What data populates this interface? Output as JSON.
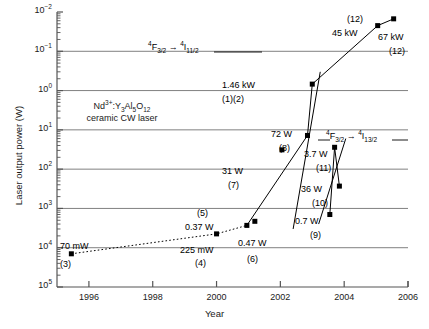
{
  "chart_data": {
    "type": "scatter",
    "title": "",
    "xlabel": "Year",
    "ylabel": "Laser output power (W)",
    "xlim": [
      1995,
      2006
    ],
    "ylim": [
      0.01,
      100000
    ],
    "yscale": "log",
    "xticks": [
      "1996",
      "1998",
      "2000",
      "2002",
      "2004",
      "2006"
    ],
    "xtick_values": [
      1996,
      1998,
      2000,
      2002,
      2004,
      2006
    ],
    "yticks": [
      "10⁻²",
      "10⁻¹",
      "10⁰",
      "10¹",
      "10²",
      "10³",
      "10⁴",
      "10⁵"
    ],
    "ytick_values": [
      0.01,
      0.1,
      1,
      10,
      100,
      1000,
      10000,
      100000
    ],
    "grid": "horizontal-major",
    "legend": "none",
    "points": [
      {
        "ref": "(3)",
        "label": "70 mW",
        "x": 1995.45,
        "y": 0.07,
        "label_pos": "above-right",
        "ref_pos": "below"
      },
      {
        "ref": "(4)",
        "label": "225 mW",
        "x": 2000.0,
        "y": 0.225,
        "label_pos": "below",
        "ref_pos": "below2"
      },
      {
        "ref": "(5)",
        "label": "0.37 W",
        "x": 2000.95,
        "y": 0.37,
        "label_pos": "above-left",
        "ref_pos": "above2"
      },
      {
        "ref": "(6)",
        "label": "0.47 W",
        "x": 2001.2,
        "y": 0.47,
        "label_pos": "right",
        "ref_pos": "below-right"
      },
      {
        "ref": "(7)",
        "label": "31 W",
        "x": 2002.05,
        "y": 31,
        "label_pos": "below",
        "ref_pos": "below2"
      },
      {
        "ref": "(8)",
        "label": "72 W",
        "x": 2002.85,
        "y": 72,
        "label_pos": "above-right",
        "ref_pos": "right-below"
      },
      {
        "ref": "(9)",
        "label": "0.7 W",
        "x": 2003.55,
        "y": 0.7,
        "label_pos": "right",
        "ref_pos": "below-right"
      },
      {
        "ref": "(10)",
        "label": "36 W",
        "x": 2003.7,
        "y": 36,
        "label_pos": "right",
        "ref_pos": "below-right"
      },
      {
        "ref": "(11)",
        "label": "3.7 W",
        "x": 2003.85,
        "y": 3.7,
        "label_pos": "right",
        "ref_pos": "below-right"
      },
      {
        "ref": "(1)(2)",
        "label": "1.46 kW",
        "x": 2003.0,
        "y": 1460,
        "label_pos": "left",
        "ref_pos": "left-below"
      },
      {
        "ref": "(12)",
        "label": "45 kW",
        "x": 2005.05,
        "y": 45000,
        "label_pos": "left",
        "ref_pos": "above-left"
      },
      {
        "ref": "(12)",
        "label": "67 kW",
        "x": 2005.55,
        "y": 67000,
        "label_pos": "below-right",
        "ref_pos": "below-right2"
      }
    ],
    "series": [
      {
        "name": "low-power trend",
        "style": "dotted",
        "x": [
          1995.45,
          2000.0,
          2000.95
        ],
        "y": [
          0.07,
          0.225,
          0.37
        ]
      },
      {
        "name": "4F3/2-4I11/2 trend",
        "style": "solid",
        "x": [
          2000.95,
          2002.85,
          2003.0,
          2005.05,
          2005.55
        ],
        "y": [
          0.37,
          72,
          1460,
          45000,
          67000
        ]
      },
      {
        "name": "4F3/2-4I13/2 trend",
        "style": "solid",
        "x": [
          2003.55,
          2003.7,
          2003.85
        ],
        "y": [
          0.7,
          36,
          3.7
        ]
      }
    ],
    "annotations": [
      {
        "id": "transition-1132",
        "text": "⁴F₃₅₂ → ⁴I₁₁₅₂",
        "html": "<sup>4</sup>F<sub>3/2</sub> → <sup>4</sup>I<sub>11/2</sub>"
      },
      {
        "id": "transition-1332",
        "text": "⁴F₃₅₂ → ⁴I₁₃₅₂",
        "html": "<sup>4</sup>F<sub>3/2</sub> → <sup>4</sup>I<sub>13/2</sub>"
      },
      {
        "id": "material",
        "line1": "Nd3+:Y3Al5O12",
        "line2": "ceramic CW laser"
      }
    ],
    "colors": {
      "marker": "#000000",
      "line": "#000000",
      "grid": "#808080",
      "axis": "#555555",
      "background": "#ffffff"
    }
  },
  "axes": {
    "y_title": "Laser output power (W)",
    "x_title": "Year",
    "y_ticks": [
      {
        "exp": "5",
        "base": "10"
      },
      {
        "exp": "4",
        "base": "10"
      },
      {
        "exp": "3",
        "base": "10"
      },
      {
        "exp": "2",
        "base": "10"
      },
      {
        "exp": "1",
        "base": "10"
      },
      {
        "exp": "0",
        "base": "10"
      },
      {
        "exp": "-1",
        "base": "10"
      },
      {
        "exp": "-2",
        "base": "10"
      }
    ],
    "x_ticks": [
      "1996",
      "1998",
      "2000",
      "2002",
      "2004",
      "2006"
    ]
  },
  "labels": {
    "p3_value": "70 mW",
    "p3_ref": "(3)",
    "p4_value": "225 mW",
    "p4_ref": "(4)",
    "p5_value": "0.37 W",
    "p5_ref": "(5)",
    "p6_value": "0.47 W",
    "p6_ref": "(6)",
    "p7_value": "31 W",
    "p7_ref": "(7)",
    "p8_value": "72 W",
    "p8_ref": "(8)",
    "p9_value": "0.7 W",
    "p9_ref": "(9)",
    "p10_value": "36 W",
    "p10_ref": "(10)",
    "p11_value": "3.7 W",
    "p11_ref": "(11)",
    "p12_value": "1.46 kW",
    "p12_ref": "(1)(2)",
    "p13_value": "45 kW",
    "p13_ref": "(12)",
    "p14_value": "67 kW",
    "p14_ref": "(12)",
    "material_line1_pre": "Nd",
    "material_line1_sup": "3+",
    "material_line1_mid": ":Y",
    "material_line1_sub1": "3",
    "material_line1_al": "Al",
    "material_line1_sub2": "5",
    "material_line1_o": "O",
    "material_line1_sub3": "12",
    "material_line2": "ceramic CW laser",
    "trans1_sup": "4",
    "trans1_f": "F",
    "trans1_sub1": "3/2",
    "trans1_arrow": "→",
    "trans1_sup2": "4",
    "trans1_i": "I",
    "trans1_sub2": "11/2",
    "trans2_sup": "4",
    "trans2_f": "F",
    "trans2_sub1": "3/2",
    "trans2_arrow": "→",
    "trans2_sup2": "4",
    "trans2_i": "I",
    "trans2_sub2": "13/2"
  }
}
